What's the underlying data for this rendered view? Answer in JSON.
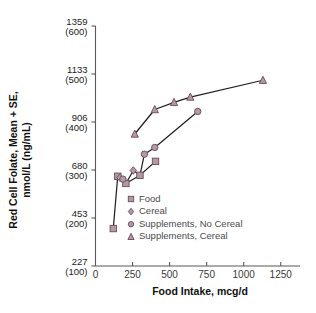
{
  "chart_data": {
    "type": "scatter",
    "title": "",
    "xlabel": "Food Intake, mcg/d",
    "ylabel": "Red Cell Folate, Mean + SE, nmol/L (ng/mL)",
    "ylabel_line1": "Red Cell Folate, Mean + SE,",
    "ylabel_line2": "nmol/L (ng/mL)",
    "xlim": [
      0,
      1380
    ],
    "ylim": [
      100,
      600
    ],
    "grid": false,
    "legend_position": "inside-center",
    "y_tick_values_ngml": [
      100,
      200,
      300,
      400,
      500,
      600
    ],
    "y_tick_labels_primary": [
      "227",
      "453",
      "680",
      "906",
      "1133",
      "1359"
    ],
    "y_tick_labels_secondary": [
      "(100)",
      "(200)",
      "(300)",
      "(400)",
      "(500)",
      "(600)"
    ],
    "x_tick_values": [
      0,
      250,
      500,
      750,
      1000,
      1250
    ],
    "x_tick_labels": [
      "0",
      "250",
      "500",
      "750",
      "1000",
      "1250"
    ],
    "marker_color": "#b09aa6",
    "marker_edge_color": "#6b4a58",
    "line_color": "#231f20",
    "series": [
      {
        "name": "Food",
        "marker": "square",
        "values": [
          {
            "x": 120,
            "y": 178
          },
          {
            "x": 150,
            "y": 287
          },
          {
            "x": 205,
            "y": 272
          },
          {
            "x": 300,
            "y": 289
          },
          {
            "x": 405,
            "y": 318
          }
        ]
      },
      {
        "name": "Cereal",
        "marker": "diamond",
        "values": [
          {
            "x": 165,
            "y": 284
          },
          {
            "x": 255,
            "y": 299
          }
        ]
      },
      {
        "name": "Supplements, No Cereal",
        "marker": "circle",
        "values": [
          {
            "x": 185,
            "y": 281
          },
          {
            "x": 330,
            "y": 333
          },
          {
            "x": 400,
            "y": 347
          },
          {
            "x": 690,
            "y": 422
          }
        ]
      },
      {
        "name": "Supplements, Cereal",
        "marker": "triangle",
        "values": [
          {
            "x": 265,
            "y": 375
          },
          {
            "x": 400,
            "y": 426
          },
          {
            "x": 530,
            "y": 441
          },
          {
            "x": 640,
            "y": 452
          },
          {
            "x": 1130,
            "y": 487
          }
        ]
      }
    ],
    "connecting_paths": [
      {
        "name": "lower-path",
        "points": [
          [
            120,
            178
          ],
          [
            150,
            287
          ],
          [
            165,
            284
          ],
          [
            185,
            281
          ],
          [
            205,
            272
          ],
          [
            255,
            299
          ],
          [
            300,
            289
          ],
          [
            330,
            333
          ],
          [
            400,
            347
          ],
          [
            690,
            422
          ]
        ]
      },
      {
        "name": "food-path",
        "points": [
          [
            205,
            272
          ],
          [
            300,
            289
          ],
          [
            405,
            318
          ]
        ]
      },
      {
        "name": "upper-path",
        "points": [
          [
            265,
            375
          ],
          [
            400,
            426
          ],
          [
            530,
            441
          ],
          [
            640,
            452
          ],
          [
            1130,
            487
          ]
        ]
      }
    ],
    "legend": [
      {
        "label": "Food",
        "marker": "square"
      },
      {
        "label": "Cereal",
        "marker": "diamond"
      },
      {
        "label": "Supplements, No Cereal",
        "marker": "circle"
      },
      {
        "label": "Supplements, Cereal",
        "marker": "triangle"
      }
    ]
  }
}
